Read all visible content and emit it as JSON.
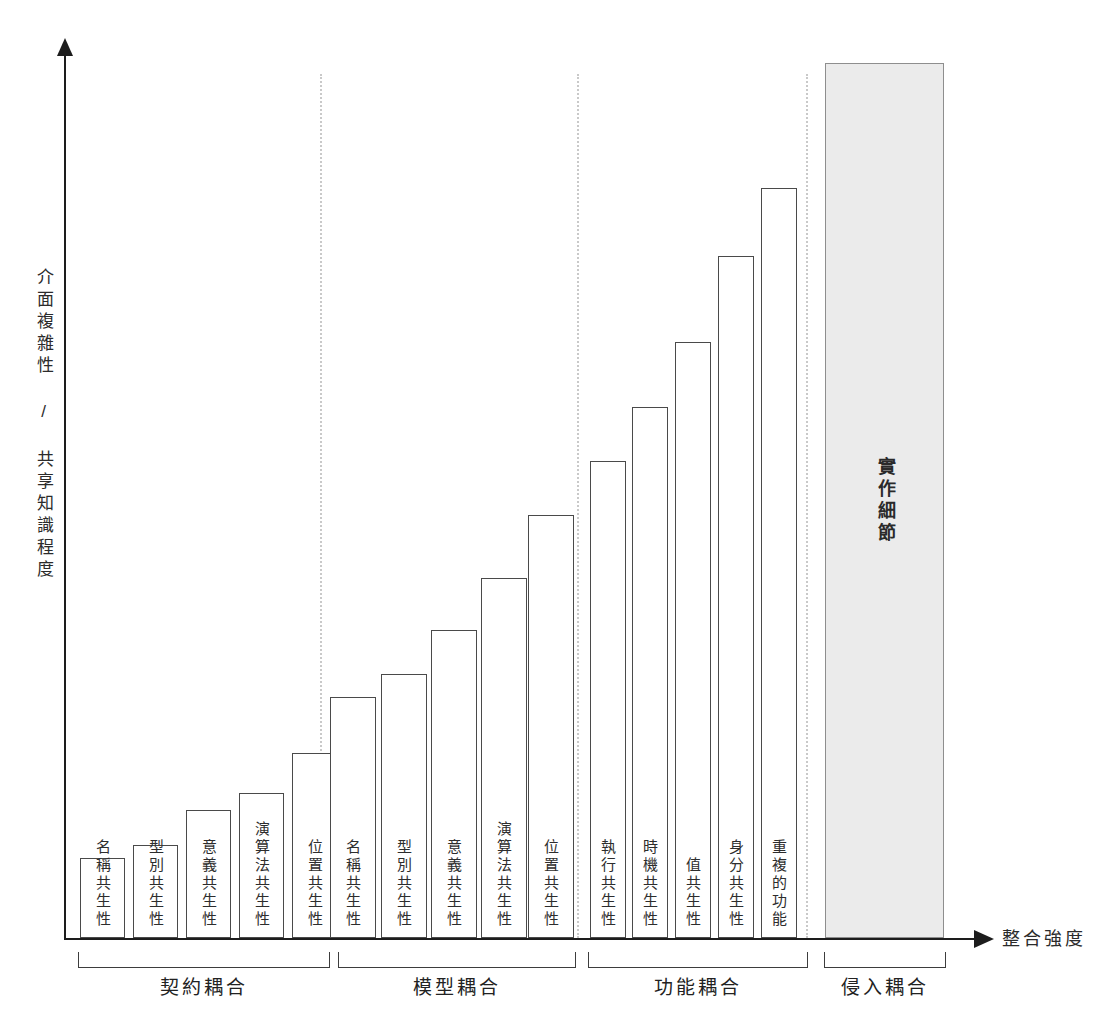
{
  "chart_data": {
    "type": "bar",
    "title": "",
    "xlabel": "整合強度",
    "ylabel": "介面複雜性 / 共享知識程度",
    "grid": false,
    "legend": "none",
    "axis_arrows": true,
    "ylim": [
      0,
      100
    ],
    "groups": [
      {
        "name": "契約耦合",
        "bars": [
          {
            "label": "名稱共生性",
            "value": 9
          },
          {
            "label": "型別共生性",
            "value": 11
          },
          {
            "label": "意義共生性",
            "value": 15
          },
          {
            "label": "演算法共生性",
            "value": 17
          },
          {
            "label": "位置共生性",
            "value": 21
          }
        ]
      },
      {
        "name": "模型耦合",
        "bars": [
          {
            "label": "名稱共生性",
            "value": 28
          },
          {
            "label": "型別共生性",
            "value": 30
          },
          {
            "label": "意義共生性",
            "value": 35
          },
          {
            "label": "演算法共生性",
            "value": 41
          },
          {
            "label": "位置共生性",
            "value": 48
          }
        ]
      },
      {
        "name": "功能耦合",
        "bars": [
          {
            "label": "執行共生性",
            "value": 54
          },
          {
            "label": "時機共生性",
            "value": 61
          },
          {
            "label": "值共生性",
            "value": 68
          },
          {
            "label": "身分共生性",
            "value": 78
          },
          {
            "label": "重複的功能",
            "value": 86
          }
        ]
      },
      {
        "name": "侵入耦合",
        "bars": [
          {
            "label": "實作細節",
            "value": 100,
            "filled": true
          }
        ]
      }
    ],
    "categories": [
      "名稱共生性",
      "型別共生性",
      "意義共生性",
      "演算法共生性",
      "位置共生性",
      "名稱共生性",
      "型別共生性",
      "意義共生性",
      "演算法共生性",
      "位置共生性",
      "執行共生性",
      "時機共生性",
      "值共生性",
      "身分共生性",
      "重複的功能",
      "實作細節"
    ],
    "values": [
      9,
      11,
      15,
      17,
      21,
      28,
      30,
      35,
      41,
      48,
      54,
      61,
      68,
      78,
      86,
      100
    ]
  },
  "geometry": {
    "baseline_y": 938,
    "plot_top_y": 63,
    "bars": [
      {
        "x": 80,
        "w": 45,
        "top": 858,
        "group": 0,
        "index": 0
      },
      {
        "x": 133,
        "w": 45,
        "top": 845,
        "group": 0,
        "index": 1
      },
      {
        "x": 186,
        "w": 45,
        "top": 810,
        "group": 0,
        "index": 2
      },
      {
        "x": 239,
        "w": 45,
        "top": 793,
        "group": 0,
        "index": 3
      },
      {
        "x": 292,
        "w": 45,
        "top": 753,
        "group": 0,
        "index": 4
      },
      {
        "x": 330,
        "w": 46,
        "top": 697,
        "group": 1,
        "index": 0
      },
      {
        "x": 381,
        "w": 46,
        "top": 674,
        "group": 1,
        "index": 1
      },
      {
        "x": 431,
        "w": 46,
        "top": 630,
        "group": 1,
        "index": 2
      },
      {
        "x": 481,
        "w": 46,
        "top": 578,
        "group": 1,
        "index": 3
      },
      {
        "x": 528,
        "w": 46,
        "top": 515,
        "group": 1,
        "index": 4
      },
      {
        "x": 590,
        "w": 36,
        "top": 461,
        "group": 2,
        "index": 0
      },
      {
        "x": 632,
        "w": 36,
        "top": 407,
        "group": 2,
        "index": 1
      },
      {
        "x": 675,
        "w": 36,
        "top": 342,
        "group": 2,
        "index": 2
      },
      {
        "x": 718,
        "w": 36,
        "top": 256,
        "group": 2,
        "index": 3
      },
      {
        "x": 761,
        "w": 36,
        "top": 188,
        "group": 2,
        "index": 4
      },
      {
        "x": 825,
        "w": 119,
        "top": 63,
        "group": 3,
        "index": 0
      }
    ],
    "separators_x": [
      320,
      577,
      806
    ],
    "brackets": [
      {
        "x": 78,
        "w": 252
      },
      {
        "x": 338,
        "w": 238
      },
      {
        "x": 588,
        "w": 220
      },
      {
        "x": 824,
        "w": 122
      }
    ]
  }
}
